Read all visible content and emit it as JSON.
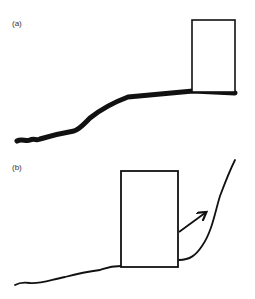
{
  "panels": [
    {
      "label": "(a)",
      "label_pos": [
        12,
        19
      ],
      "box": {
        "x": 192,
        "y": 20,
        "w": 43,
        "h": 72
      },
      "path": "M17,141 C22,138 26,142 30,140 C34,138 37,141 40,139 C50,136 62,133 74,131 C80,129 84,124 90,118 C100,110 112,103 128,97 L193,91 L235,93",
      "stroke_width": 5,
      "stroke": "#111111"
    },
    {
      "label": "(b)",
      "label_pos": [
        12,
        163
      ],
      "box": {
        "x": 121,
        "y": 171,
        "w": 57,
        "h": 96
      },
      "path_left": "M15,285 C20,282 24,282 30,283 C40,284 50,280 65,277 C80,273 92,271 100,270 C106,268 110,266 121,266",
      "path_right": "M179,260 C190,260 196,255 202,246 C212,232 215,212 220,196 C226,180 230,170 235,160",
      "arrow": {
        "x1": 179,
        "y1": 232,
        "x2": 205,
        "y2": 213
      },
      "stroke_width": 1.8,
      "stroke": "#111111"
    }
  ]
}
